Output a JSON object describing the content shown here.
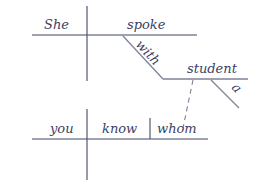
{
  "diagram": {
    "type": "sentence-diagram",
    "main_clause": {
      "subject": "She",
      "verb": "spoke",
      "preposition": "with",
      "object_of_preposition": "student",
      "article": "a"
    },
    "relative_clause": {
      "subject": "you",
      "verb": "know",
      "object": "whom"
    },
    "colors": {
      "text": "#3a3f63",
      "lines": "#7e8298"
    }
  }
}
